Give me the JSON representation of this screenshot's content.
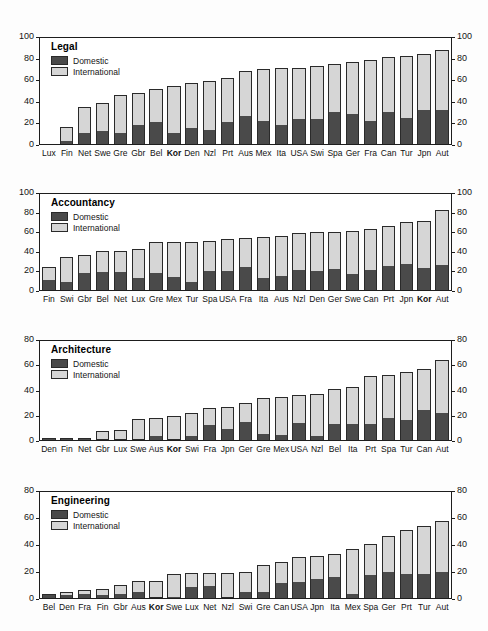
{
  "figure": {
    "series_labels": {
      "domestic": "Domestic",
      "international": "International"
    },
    "colors": {
      "domestic": "#4a4a4a",
      "international": "#d6d6d6",
      "axis": "#1d1d1d"
    }
  },
  "chart_data": [
    {
      "type": "bar",
      "title": "Legal",
      "xlabel": "",
      "ylabel": "",
      "ylim": [
        0,
        100
      ],
      "yticks": [
        0,
        20,
        40,
        60,
        80,
        100
      ],
      "grid": false,
      "legend": "top-left",
      "stacked": true,
      "highlight": "Kor",
      "categories": [
        "Lux",
        "Fin",
        "Net",
        "Swe",
        "Gre",
        "Gbr",
        "Bel",
        "Kor",
        "Den",
        "Nzl",
        "Prt",
        "Aus",
        "Mex",
        "Ita",
        "USA",
        "Swi",
        "Spa",
        "Ger",
        "Fra",
        "Can",
        "Tur",
        "Jpn",
        "Aut"
      ],
      "series": [
        {
          "name": "Domestic",
          "values": [
            0,
            3,
            10,
            12.5,
            10,
            18,
            21,
            10.5,
            15,
            13,
            21,
            26.5,
            22,
            17.5,
            24,
            24,
            30.5,
            28.5,
            21.5,
            30.5,
            25,
            32,
            32
          ]
        },
        {
          "name": "International",
          "values": [
            0,
            13.5,
            25,
            26,
            36.5,
            30.5,
            30.5,
            44,
            43,
            46.5,
            41,
            42,
            48.5,
            54,
            48,
            49.5,
            45,
            49,
            58,
            51.5,
            58,
            52.5,
            57
          ]
        }
      ],
      "totals": [
        0,
        16.5,
        35,
        38.5,
        46.5,
        48.5,
        51.5,
        54.5,
        58,
        59.5,
        62,
        68.5,
        70.5,
        71.5,
        72,
        73.5,
        75.5,
        77.5,
        79.5,
        82,
        83,
        84.5,
        89
      ]
    },
    {
      "type": "bar",
      "title": "Accountancy",
      "xlabel": "",
      "ylabel": "",
      "ylim": [
        0,
        100
      ],
      "yticks": [
        0,
        20,
        40,
        60,
        80,
        100
      ],
      "grid": false,
      "legend": "top-left",
      "stacked": true,
      "highlight": "Kor",
      "categories": [
        "Fin",
        "Swi",
        "Gbr",
        "Bel",
        "Net",
        "Lux",
        "Gre",
        "Mex",
        "Tur",
        "Spa",
        "USA",
        "Fra",
        "Ita",
        "Aus",
        "Nzl",
        "Den",
        "Ger",
        "Swe",
        "Can",
        "Prt",
        "Jpn",
        "Kor",
        "Aut"
      ],
      "series": [
        {
          "name": "Domestic",
          "values": [
            10,
            8,
            18,
            18.5,
            18.5,
            12,
            18,
            13.5,
            8,
            20,
            20,
            24,
            13,
            15,
            21,
            20,
            21.5,
            17,
            20.5,
            25.5,
            27,
            23,
            26
          ]
        },
        {
          "name": "International",
          "values": [
            13.5,
            26.5,
            18.5,
            22,
            22,
            30.5,
            32,
            36.5,
            42,
            31,
            33,
            30.5,
            42.5,
            41.5,
            38.5,
            40.5,
            39,
            44.5,
            43,
            41,
            43.5,
            48.5,
            57
          ]
        }
      ],
      "totals": [
        23.5,
        34.5,
        36.5,
        40.5,
        40.5,
        42.5,
        50,
        50,
        50,
        51,
        53,
        54.5,
        55.5,
        56.5,
        59.5,
        60.5,
        60.5,
        61.5,
        63.5,
        66.5,
        70.5,
        71.5,
        83
      ]
    },
    {
      "type": "bar",
      "title": "Architecture",
      "xlabel": "",
      "ylabel": "",
      "ylim": [
        0,
        80
      ],
      "yticks": [
        0,
        20,
        40,
        60,
        80
      ],
      "grid": false,
      "legend": "top-left",
      "stacked": true,
      "highlight": "Kor",
      "categories": [
        "Den",
        "Fin",
        "Net",
        "Gbr",
        "Lux",
        "Swe",
        "Aus",
        "Kor",
        "Swi",
        "Fra",
        "Jpn",
        "Ger",
        "Gre",
        "Mex",
        "USA",
        "Nzl",
        "Bel",
        "Ita",
        "Prt",
        "Spa",
        "Tur",
        "Can",
        "Aut"
      ],
      "series": [
        {
          "name": "Domestic",
          "values": [
            2,
            2,
            2,
            0,
            0,
            0,
            3,
            0,
            3.5,
            12,
            8.5,
            14.5,
            5,
            4,
            13.5,
            3,
            13,
            13,
            13,
            18,
            16.5,
            24.5,
            22
          ]
        },
        {
          "name": "International",
          "values": [
            0,
            0,
            0,
            7,
            8,
            17,
            15,
            19.5,
            18.5,
            14,
            18.5,
            15.5,
            29,
            30.5,
            22.5,
            34,
            28.5,
            29.5,
            38.5,
            34.5,
            38.5,
            33,
            43
          ]
        }
      ],
      "totals": [
        2,
        2,
        2,
        7,
        8,
        17,
        18,
        19.5,
        22,
        26,
        27,
        30,
        34,
        34.5,
        36,
        37,
        41.5,
        42.5,
        51.5,
        52.5,
        55,
        57.5,
        65
      ]
    },
    {
      "type": "bar",
      "title": "Engineering",
      "xlabel": "",
      "ylabel": "",
      "ylim": [
        0,
        80
      ],
      "yticks": [
        0,
        20,
        40,
        60,
        80
      ],
      "grid": false,
      "legend": "top-left",
      "stacked": true,
      "highlight": "Kor",
      "categories": [
        "Bel",
        "Den",
        "Fra",
        "Fin",
        "Gbr",
        "Aus",
        "Kor",
        "Swe",
        "Lux",
        "Net",
        "Nzl",
        "Swi",
        "Gre",
        "Can",
        "USA",
        "Jpn",
        "Ita",
        "Mex",
        "Spa",
        "Ger",
        "Prt",
        "Tur",
        "Aut"
      ],
      "series": [
        {
          "name": "Domestic",
          "values": [
            2,
            2.5,
            3,
            2.5,
            3,
            4.5,
            0,
            1,
            8.5,
            9,
            0,
            4.5,
            4.5,
            11,
            12,
            14,
            15.5,
            3,
            17,
            20,
            18,
            18,
            19.5
          ]
        },
        {
          "name": "International",
          "values": [
            0.5,
            2,
            3,
            4,
            6.5,
            8,
            12.5,
            17,
            10.5,
            10,
            19,
            15.5,
            20.5,
            16,
            19,
            18,
            17.5,
            34,
            24,
            27,
            33,
            36.5,
            39
          ]
        }
      ],
      "totals": [
        2.5,
        4.5,
        6,
        6.5,
        9.5,
        12.5,
        12.5,
        18,
        19,
        19,
        19,
        20,
        25,
        27,
        31,
        32,
        33,
        37,
        41,
        47,
        51,
        54.5,
        58.5
      ]
    }
  ]
}
